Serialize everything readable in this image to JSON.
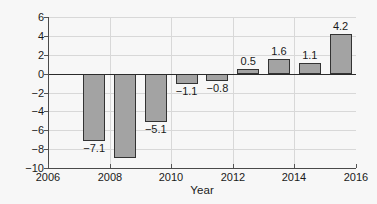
{
  "chart_data": {
    "type": "bar",
    "title": "",
    "xlabel": "Year",
    "ylabel": "Current account (%GDP)",
    "categories": [
      2007,
      2008,
      2009,
      2010,
      2011,
      2012,
      2013,
      2014,
      2015
    ],
    "values": [
      -7.1,
      -8.9,
      -5.1,
      -1.1,
      -0.8,
      0.5,
      1.6,
      1.1,
      4.2
    ],
    "point_labels": [
      "−7.1",
      "",
      "−5.1",
      "−1.1",
      "−0.8",
      "0.5",
      "1.6",
      "1.1",
      "4.2"
    ],
    "xlim": [
      2006,
      2016
    ],
    "ylim": [
      -10,
      6
    ],
    "xticks": [
      2006,
      2008,
      2010,
      2012,
      2014,
      2016
    ],
    "xtick_labels": [
      "2006",
      "2008",
      "2010",
      "2012",
      "2014",
      "2016"
    ],
    "yticks": [
      6,
      4,
      2,
      0,
      -2,
      -4,
      -6,
      -8,
      -10
    ],
    "ytick_labels": [
      "6",
      "4",
      "2",
      "0",
      "−2",
      "−4",
      "−6",
      "−8",
      "−10"
    ],
    "grid": true,
    "legend": false,
    "bar_color": "#a3a3a3",
    "bar_edge_color": "#333333",
    "background_color": "#f7f7f7"
  }
}
